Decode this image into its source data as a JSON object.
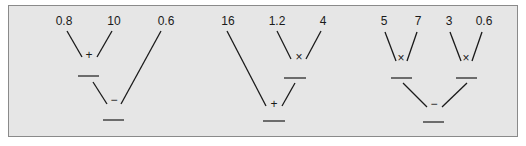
{
  "diagrams": [
    {
      "name": "tree-1",
      "inputs": [
        "0.8",
        "10",
        "0.6"
      ],
      "operations": [
        "+",
        "−"
      ]
    },
    {
      "name": "tree-2",
      "inputs": [
        "16",
        "1.2",
        "4"
      ],
      "operations": [
        "×",
        "+"
      ]
    },
    {
      "name": "tree-3",
      "inputs": [
        "5",
        "7",
        "3",
        "0.6"
      ],
      "operations": [
        "×",
        "×",
        "−"
      ]
    }
  ],
  "colors": {
    "panel": "#e6e6e6",
    "border": "#8a8a8a",
    "ink": "#1a1a1a"
  }
}
